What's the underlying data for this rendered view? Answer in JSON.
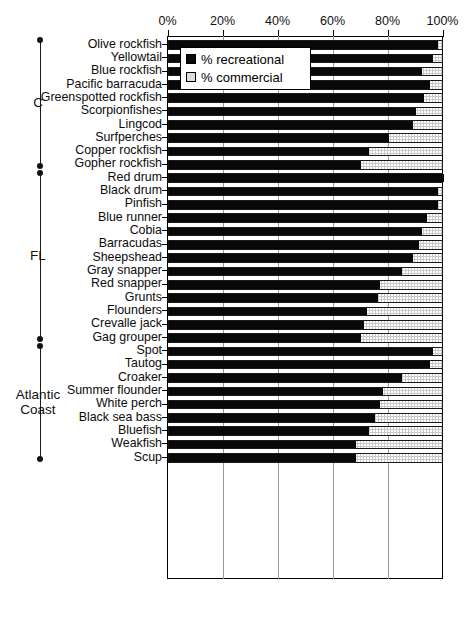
{
  "chart_data": {
    "type": "bar",
    "orientation": "horizontal",
    "stacked": true,
    "title": "",
    "xlabel": "",
    "ylabel": "",
    "xlim": [
      0,
      100
    ],
    "grid": true,
    "legend_position": "top-left-inside",
    "xticks": [
      "0%",
      "20%",
      "40%",
      "60%",
      "80%",
      "100%"
    ],
    "xtick_values": [
      0,
      20,
      40,
      60,
      80,
      100
    ],
    "series": [
      {
        "name": "% recreational",
        "key": "recreational",
        "color": "#080808"
      },
      {
        "name": "% commercial",
        "key": "commercial",
        "color": "#c9c9c9"
      }
    ],
    "categories": [
      "Olive rockfish",
      "Yellowtail",
      "Blue rockfish",
      "Pacific barracuda",
      "Greenspotted rockfish",
      "Scorpionfishes",
      "Lingcod",
      "Surfperches",
      "Copper rockfish",
      "Gopher rockfish",
      "Red drum",
      "Black drum",
      "Pinfish",
      "Blue runner",
      "Cobia",
      "Barracudas",
      "Sheepshead",
      "Gray snapper",
      "Red snapper",
      "Grunts",
      "Flounders",
      "Crevalle jack",
      "Gag grouper",
      "Spot",
      "Tautog",
      "Croaker",
      "Summer flounder",
      "White perch",
      "Black sea bass",
      "Bluefish",
      "Weakfish",
      "Scup"
    ],
    "recreational": [
      98,
      96,
      92,
      95,
      93,
      90,
      89,
      80,
      73,
      70,
      100,
      98,
      98,
      94,
      92,
      91,
      89,
      85,
      77,
      76,
      72,
      71,
      70,
      96,
      95,
      85,
      78,
      77,
      75,
      73,
      68,
      68
    ],
    "commercial": [
      2,
      4,
      8,
      5,
      7,
      10,
      11,
      20,
      27,
      30,
      0,
      2,
      2,
      6,
      8,
      9,
      11,
      15,
      23,
      24,
      28,
      29,
      30,
      4,
      5,
      15,
      22,
      23,
      25,
      27,
      32,
      32
    ],
    "groups": [
      {
        "label": "C",
        "start": 0,
        "end": 9
      },
      {
        "label": "FL",
        "start": 10,
        "end": 22
      },
      {
        "label": "Atlantic\nCoast",
        "label_line1": "Atlantic",
        "label_line2": "Coast",
        "start": 23,
        "end": 31
      }
    ]
  },
  "legend": {
    "items": [
      {
        "label": "% recreational",
        "swatch": "filled-black-square"
      },
      {
        "label": "% commercial",
        "swatch": "open-light-square"
      }
    ]
  },
  "colors": {
    "recreational": "#080808",
    "commercial": "#c9c9c9",
    "axis": "#000000",
    "grid": "#9a9a9a",
    "background": "#ffffff"
  }
}
